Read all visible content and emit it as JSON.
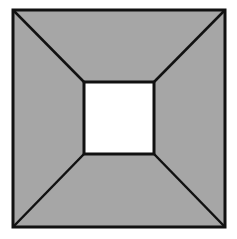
{
  "diagram": {
    "colors": {
      "background": "#ffffff",
      "fill": "#a6a6a6",
      "inner": "#ffffff",
      "stroke": "#111111"
    },
    "outer_square": {
      "x1": 13,
      "y1": 10,
      "x2": 225,
      "y2": 227
    },
    "inner_square": {
      "x1": 84,
      "y1": 82,
      "x2": 154,
      "y2": 154
    }
  }
}
